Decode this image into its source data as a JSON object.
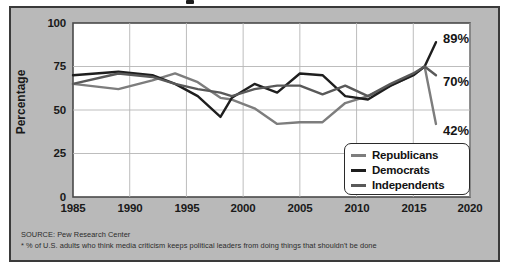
{
  "figure": {
    "background": "#b9b9b9",
    "plot_background": "#ffffff",
    "border_color": "#3a3a3a"
  },
  "axis": {
    "y_label": "Percentage",
    "y_ticks": [
      "0",
      "25",
      "50",
      "75",
      "100"
    ],
    "x_ticks": [
      "1985",
      "1990",
      "1995",
      "2000",
      "2005",
      "2010",
      "2015",
      "2020"
    ]
  },
  "legend": {
    "items": [
      {
        "label": "Republicans",
        "color": "#7d7d7d"
      },
      {
        "label": "Democrats",
        "color": "#1e1e1e"
      },
      {
        "label": "Independents",
        "color": "#595959"
      }
    ]
  },
  "end_labels": [
    {
      "text": "89%",
      "series": "Democrats"
    },
    {
      "text": "70%",
      "series": "Independents"
    },
    {
      "text": "42%",
      "series": "Republicans"
    }
  ],
  "source": {
    "line1": "SOURCE: Pew Research Center",
    "line2": "* % of U.S. adults who think media criticism keeps political leaders from doing things that shouldn't be done"
  },
  "chart_data": {
    "type": "line",
    "title": "",
    "xlabel": "",
    "ylabel": "Percentage",
    "xlim": [
      1985,
      2020
    ],
    "ylim": [
      0,
      100
    ],
    "yticks": [
      0,
      25,
      50,
      75,
      100
    ],
    "xticks": [
      1985,
      1990,
      1995,
      2000,
      2005,
      2010,
      2015,
      2020
    ],
    "grid": true,
    "legend_position": "lower-right",
    "x": [
      1985,
      1989,
      1992,
      1994,
      1996,
      1998,
      1999,
      2001,
      2003,
      2005,
      2007,
      2009,
      2011,
      2013,
      2015,
      2016,
      2017
    ],
    "series": [
      {
        "name": "Republicans",
        "color": "#7d7d7d",
        "values": [
          65,
          62,
          67,
          71,
          66,
          57,
          56,
          51,
          42,
          43,
          43,
          54,
          58,
          64,
          70,
          75,
          42
        ],
        "end_label": "42%"
      },
      {
        "name": "Democrats",
        "color": "#1e1e1e",
        "values": [
          70,
          72,
          70,
          65,
          58,
          46,
          57,
          65,
          60,
          71,
          70,
          58,
          56,
          64,
          70,
          75,
          89
        ],
        "end_label": "89%"
      },
      {
        "name": "Independents",
        "color": "#595959",
        "values": [
          65,
          71,
          69,
          65,
          62,
          60,
          58,
          62,
          64,
          64,
          59,
          64,
          58,
          65,
          71,
          75,
          70
        ],
        "end_label": "70%"
      }
    ],
    "annotations": [
      {
        "text": "89%",
        "x": 2018.2,
        "y": 89
      },
      {
        "text": "70%",
        "x": 2018.2,
        "y": 70
      },
      {
        "text": "42%",
        "x": 2018.2,
        "y": 42
      }
    ]
  }
}
